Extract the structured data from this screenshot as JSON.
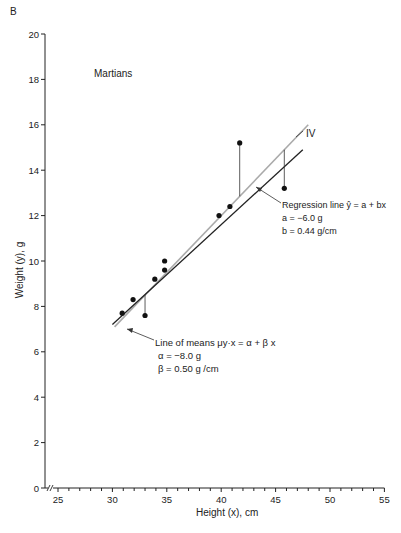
{
  "panel_label": "B",
  "chart_data": {
    "type": "scatter",
    "title": "Martians",
    "xlabel": "Height (x), cm",
    "ylabel": "Weight (y), g",
    "xlim": [
      24,
      55
    ],
    "ylim": [
      0,
      20
    ],
    "x_ticks": [
      25,
      30,
      35,
      40,
      45,
      50,
      55
    ],
    "x_minor_step": 1,
    "y_ticks": [
      0,
      2,
      4,
      6,
      8,
      10,
      12,
      14,
      16,
      18,
      20
    ],
    "grid": false,
    "axis_break": true,
    "points": [
      {
        "x": 30.9,
        "y": 7.7
      },
      {
        "x": 31.9,
        "y": 8.3
      },
      {
        "x": 33.0,
        "y": 7.6
      },
      {
        "x": 33.9,
        "y": 9.2
      },
      {
        "x": 34.8,
        "y": 9.6
      },
      {
        "x": 34.8,
        "y": 10.0
      },
      {
        "x": 39.8,
        "y": 12.0
      },
      {
        "x": 40.8,
        "y": 12.4
      },
      {
        "x": 41.7,
        "y": 15.2
      },
      {
        "x": 45.8,
        "y": 13.2
      }
    ],
    "residual_markers": [
      {
        "x": 33.0,
        "y_from": 7.6,
        "y_to": 8.5
      },
      {
        "x": 41.7,
        "y_from": 15.2,
        "y_to": 12.85
      },
      {
        "x": 45.8,
        "y_from": 13.2,
        "y_to": 14.9
      }
    ],
    "series": [
      {
        "name": "Regression line",
        "type": "line",
        "color": "#222222",
        "intercept": -6.0,
        "slope": 0.44,
        "x_range": [
          30,
          47.5
        ]
      },
      {
        "name": "Line of means",
        "type": "line",
        "color": "#aaaaaa",
        "intercept": -8.0,
        "slope": 0.5,
        "x_range": [
          30.2,
          48
        ]
      }
    ],
    "annotations": [
      {
        "id": "iv",
        "text": "IV"
      },
      {
        "id": "regression",
        "lines": [
          "Regression line ŷ = a + bx",
          "a = −6.0 g",
          "b = 0.44 g/cm"
        ]
      },
      {
        "id": "means",
        "lines": [
          "Line of means  μy·x = α + β x",
          "α = −8.0 g",
          "β = 0.50 g /cm"
        ]
      }
    ]
  }
}
